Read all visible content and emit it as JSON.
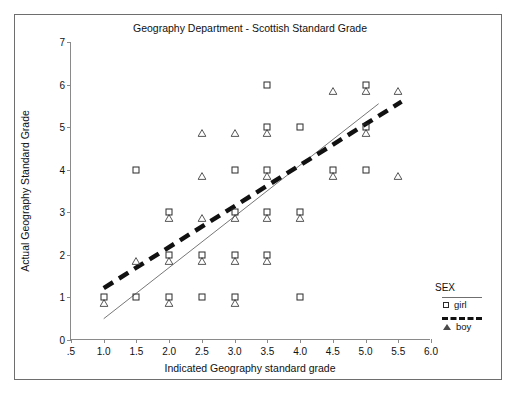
{
  "top_crumb": "",
  "chart_data": {
    "type": "scatter",
    "title": "Geography Department - Scottish Standard Grade",
    "xlabel": "Indicated Geography standard grade",
    "ylabel": "Actual Geography Standard Grade",
    "xlim": [
      0.5,
      6.0
    ],
    "ylim": [
      0,
      7
    ],
    "xticks": [
      ".5",
      "1.0",
      "1.5",
      "2.0",
      "2.5",
      "3.0",
      "3.5",
      "4.0",
      "4.5",
      "5.0",
      "5.5",
      "6.0"
    ],
    "xtick_values": [
      0.5,
      1.0,
      1.5,
      2.0,
      2.5,
      3.0,
      3.5,
      4.0,
      4.5,
      5.0,
      5.5,
      6.0
    ],
    "yticks": [
      "0",
      "1",
      "2",
      "3",
      "4",
      "5",
      "6",
      "7"
    ],
    "ytick_values": [
      0,
      1,
      2,
      3,
      4,
      5,
      6,
      7
    ],
    "grid": false,
    "legend_position": "right",
    "legend_title": "SEX",
    "series": [
      {
        "name": "girl",
        "marker": "square",
        "line_style": "solid-thin",
        "points": [
          [
            1.0,
            1
          ],
          [
            1.5,
            1
          ],
          [
            2.0,
            1
          ],
          [
            2.5,
            1
          ],
          [
            3.0,
            1
          ],
          [
            4.0,
            1
          ],
          [
            2.0,
            2
          ],
          [
            2.5,
            2
          ],
          [
            3.0,
            2
          ],
          [
            3.5,
            2
          ],
          [
            2.0,
            3
          ],
          [
            3.0,
            3
          ],
          [
            3.5,
            3
          ],
          [
            4.0,
            3
          ],
          [
            1.5,
            4
          ],
          [
            3.0,
            4
          ],
          [
            3.5,
            4
          ],
          [
            4.5,
            4
          ],
          [
            5.0,
            4
          ],
          [
            3.5,
            5
          ],
          [
            4.0,
            5
          ],
          [
            5.0,
            5
          ],
          [
            3.5,
            6
          ],
          [
            5.0,
            6
          ]
        ],
        "fit_line": {
          "x0": 1.0,
          "y0": 0.5,
          "x1": 5.2,
          "y1": 5.55
        }
      },
      {
        "name": "boy",
        "marker": "triangle",
        "line_style": "dashed-thick",
        "points": [
          [
            1.0,
            1
          ],
          [
            2.0,
            1
          ],
          [
            3.0,
            1
          ],
          [
            1.5,
            2
          ],
          [
            2.0,
            2
          ],
          [
            2.5,
            2
          ],
          [
            3.0,
            2
          ],
          [
            3.5,
            2
          ],
          [
            2.0,
            3
          ],
          [
            2.5,
            3
          ],
          [
            3.0,
            3
          ],
          [
            3.5,
            3
          ],
          [
            4.0,
            3
          ],
          [
            2.5,
            4
          ],
          [
            3.5,
            4
          ],
          [
            4.5,
            4
          ],
          [
            5.5,
            4
          ],
          [
            2.5,
            5
          ],
          [
            3.0,
            5
          ],
          [
            3.5,
            5
          ],
          [
            5.0,
            5
          ],
          [
            4.5,
            6
          ],
          [
            5.0,
            6
          ],
          [
            5.5,
            6
          ]
        ],
        "fit_line": {
          "x0": 1.0,
          "y0": 1.22,
          "x1": 5.55,
          "y1": 5.6
        }
      }
    ]
  },
  "legend": {
    "title": "SEX",
    "entries": [
      {
        "label": "girl",
        "marker": "square",
        "line": "thin-solid"
      },
      {
        "label": "boy",
        "marker": "triangle",
        "line": "thick-dashed"
      }
    ]
  }
}
